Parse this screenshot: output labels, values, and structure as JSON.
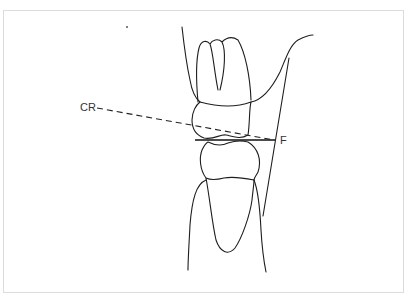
{
  "figure": {
    "labels": {
      "cr": "CR",
      "f": "F"
    },
    "elements": {
      "upper_tooth": "maxillary molar",
      "lower_tooth": "mandibular premolar",
      "dashed_line": "CR line",
      "occlusal_line": "occlusal plane",
      "angle_line": "F vertical reference"
    },
    "colors": {
      "line": "#1e1e1e",
      "border": "#dcdcdc",
      "background": "#ffffff"
    }
  }
}
